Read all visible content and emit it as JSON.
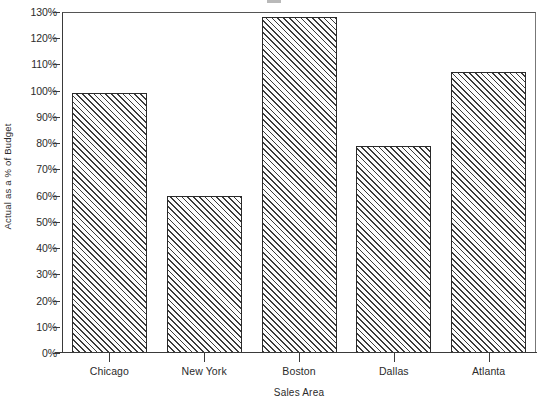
{
  "chart_data": {
    "type": "bar",
    "title": "",
    "xlabel": "Sales Area",
    "ylabel": "Actual as a % of Budget",
    "categories": [
      "Chicago",
      "New York",
      "Boston",
      "Dallas",
      "Atlanta"
    ],
    "values": [
      99,
      60,
      128,
      79,
      107
    ],
    "value_labels": [
      "99%",
      "60%",
      "128%",
      "79%",
      "107%"
    ],
    "ylim": [
      0,
      130
    ],
    "y_ticks": [
      0,
      10,
      20,
      30,
      40,
      50,
      60,
      70,
      80,
      90,
      100,
      110,
      120,
      130
    ],
    "y_tick_labels": [
      "0%",
      "10%",
      "20%",
      "30%",
      "40%",
      "50%",
      "60%",
      "70%",
      "80%",
      "90%",
      "100%",
      "110%",
      "120%",
      "130%"
    ],
    "grid": false,
    "legend": null,
    "series": [
      {
        "name": "Actual as a % of Budget",
        "values": [
          99,
          60,
          128,
          79,
          107
        ],
        "fill": "diagonal-hatch",
        "fill_color": "#3b3b3b",
        "background_color": "#fcfcfc",
        "border_color": "#2a2a2a"
      }
    ],
    "axis_color": "#3a3a3a",
    "text_color": "#2b2b2b",
    "background_color": "#ffffff"
  }
}
